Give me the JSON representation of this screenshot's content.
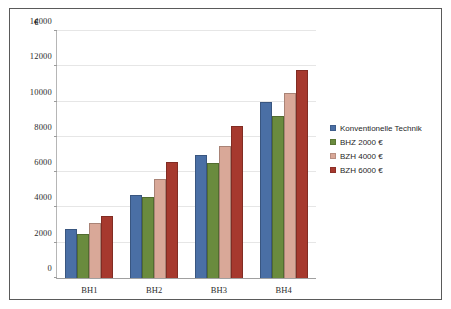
{
  "chart_data": {
    "type": "bar",
    "title": "",
    "xlabel": "",
    "ylabel": "€",
    "ylim": [
      0,
      14000
    ],
    "ytick_step": 2000,
    "yticks": [
      "0",
      "2000",
      "4000",
      "6000",
      "8000",
      "10000",
      "12000",
      "14000"
    ],
    "grid": true,
    "legend_position": "right",
    "categories": [
      "BH1",
      "BH2",
      "BH3",
      "BH4"
    ],
    "series": [
      {
        "name": "Konventionelle Technik",
        "color": "#4A6FA5",
        "values": [
          2750,
          4700,
          7000,
          10000
        ]
      },
      {
        "name": "BHZ 2000 €",
        "color": "#6A8B3E",
        "values": [
          2500,
          4600,
          6500,
          9200
        ]
      },
      {
        "name": "BZH 4000 €",
        "color": "#D9A898",
        "values": [
          3100,
          5600,
          7500,
          10500
        ]
      },
      {
        "name": "BZH 6000 €",
        "color": "#A6392E",
        "values": [
          3500,
          6600,
          8600,
          11800
        ]
      }
    ]
  }
}
